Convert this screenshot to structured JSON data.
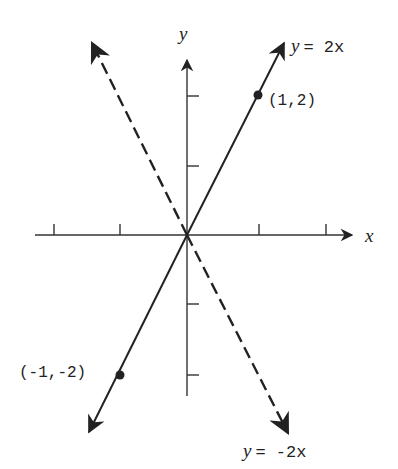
{
  "diagram": {
    "axes": {
      "x_label": "x",
      "y_label": "y"
    },
    "lines": [
      {
        "equation": "y = 2x",
        "var": "y",
        "rhs": "= 2x",
        "style": "solid"
      },
      {
        "equation": "y = -2x",
        "var": "y",
        "rhs": "= -2x",
        "style": "dashed"
      }
    ],
    "points": [
      {
        "label": "(1,2)",
        "x": 1,
        "y": 2
      },
      {
        "label": "(-1,-2)",
        "x": -1,
        "y": -2
      }
    ],
    "x_ticks": [
      -2,
      -1,
      1,
      2
    ],
    "y_ticks": [
      -2,
      -1,
      1,
      2
    ],
    "colors": {
      "ink": "#222222",
      "background": "#ffffff"
    }
  }
}
